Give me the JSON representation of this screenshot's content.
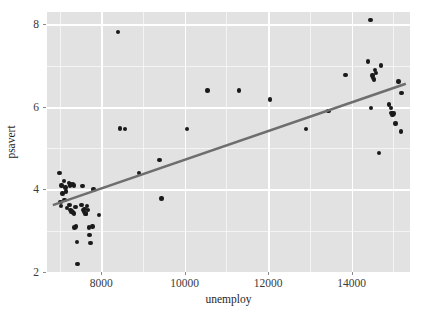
{
  "chart_data": {
    "type": "scatter",
    "title": "",
    "xlabel": "unemploy",
    "ylabel": "psavert",
    "xlim": [
      6700,
      15400
    ],
    "ylim": [
      2.0,
      8.3
    ],
    "xticks": [
      8000,
      10000,
      12000,
      14000
    ],
    "xtick_labels": [
      "8000",
      "10000",
      "12000",
      "14000"
    ],
    "yticks": [
      2,
      4,
      6,
      8
    ],
    "ytick_labels": [
      "2",
      "4",
      "6",
      "8"
    ],
    "xminorticks": [
      7000,
      9000,
      11000,
      13000,
      15000
    ],
    "yminorticks": [
      3,
      5,
      7
    ],
    "grid": true,
    "legend": "none",
    "panel_background": "#e2e2e2",
    "grid_color": "#ffffff",
    "point_color": "#1a1a1a",
    "trend_color": "#6e6e6e",
    "points": [
      {
        "x": 7000,
        "y": 4.4
      },
      {
        "x": 7050,
        "y": 4.1
      },
      {
        "x": 7070,
        "y": 3.9
      },
      {
        "x": 7020,
        "y": 3.7
      },
      {
        "x": 7030,
        "y": 3.6
      },
      {
        "x": 7110,
        "y": 4.2
      },
      {
        "x": 7140,
        "y": 4.05
      },
      {
        "x": 7160,
        "y": 3.95
      },
      {
        "x": 7120,
        "y": 3.75
      },
      {
        "x": 7180,
        "y": 3.55
      },
      {
        "x": 7230,
        "y": 4.15
      },
      {
        "x": 7250,
        "y": 4.1
      },
      {
        "x": 7270,
        "y": 4.12
      },
      {
        "x": 7240,
        "y": 3.62
      },
      {
        "x": 7260,
        "y": 3.5
      },
      {
        "x": 7290,
        "y": 3.45
      },
      {
        "x": 7300,
        "y": 3.48
      },
      {
        "x": 7330,
        "y": 4.12
      },
      {
        "x": 7350,
        "y": 4.1
      },
      {
        "x": 7380,
        "y": 3.58
      },
      {
        "x": 7320,
        "y": 3.44
      },
      {
        "x": 7340,
        "y": 3.42
      },
      {
        "x": 7400,
        "y": 3.1
      },
      {
        "x": 7360,
        "y": 3.08
      },
      {
        "x": 7420,
        "y": 2.72
      },
      {
        "x": 7430,
        "y": 2.2
      },
      {
        "x": 7550,
        "y": 4.08
      },
      {
        "x": 7530,
        "y": 3.62
      },
      {
        "x": 7560,
        "y": 3.5
      },
      {
        "x": 7580,
        "y": 3.45
      },
      {
        "x": 7600,
        "y": 3.52
      },
      {
        "x": 7620,
        "y": 3.4
      },
      {
        "x": 7640,
        "y": 3.42
      },
      {
        "x": 7660,
        "y": 3.6
      },
      {
        "x": 7680,
        "y": 3.5
      },
      {
        "x": 7700,
        "y": 3.08
      },
      {
        "x": 7720,
        "y": 2.9
      },
      {
        "x": 7740,
        "y": 2.7
      },
      {
        "x": 7790,
        "y": 3.1
      },
      {
        "x": 7810,
        "y": 4.0
      },
      {
        "x": 7950,
        "y": 3.38
      },
      {
        "x": 8400,
        "y": 7.82
      },
      {
        "x": 8450,
        "y": 5.48
      },
      {
        "x": 8570,
        "y": 5.46
      },
      {
        "x": 8900,
        "y": 4.4
      },
      {
        "x": 9400,
        "y": 4.72
      },
      {
        "x": 9440,
        "y": 3.78
      },
      {
        "x": 10050,
        "y": 5.46
      },
      {
        "x": 10550,
        "y": 6.4
      },
      {
        "x": 11300,
        "y": 6.4
      },
      {
        "x": 12050,
        "y": 6.18
      },
      {
        "x": 12900,
        "y": 5.46
      },
      {
        "x": 13450,
        "y": 5.9
      },
      {
        "x": 13850,
        "y": 6.78
      },
      {
        "x": 14450,
        "y": 8.1
      },
      {
        "x": 14400,
        "y": 7.1
      },
      {
        "x": 14500,
        "y": 6.76
      },
      {
        "x": 14520,
        "y": 6.7
      },
      {
        "x": 14540,
        "y": 6.66
      },
      {
        "x": 14560,
        "y": 6.9
      },
      {
        "x": 14580,
        "y": 6.82
      },
      {
        "x": 14700,
        "y": 7.0
      },
      {
        "x": 14460,
        "y": 5.98
      },
      {
        "x": 14660,
        "y": 4.88
      },
      {
        "x": 14900,
        "y": 6.06
      },
      {
        "x": 14940,
        "y": 5.98
      },
      {
        "x": 14960,
        "y": 5.86
      },
      {
        "x": 14980,
        "y": 5.8
      },
      {
        "x": 15000,
        "y": 5.84
      },
      {
        "x": 15050,
        "y": 5.6
      },
      {
        "x": 15120,
        "y": 6.62
      },
      {
        "x": 15200,
        "y": 6.34
      },
      {
        "x": 15180,
        "y": 5.4
      }
    ],
    "trend_line": {
      "x_start": 6840,
      "y_start": 3.62,
      "x_end": 15300,
      "y_end": 6.56
    }
  }
}
